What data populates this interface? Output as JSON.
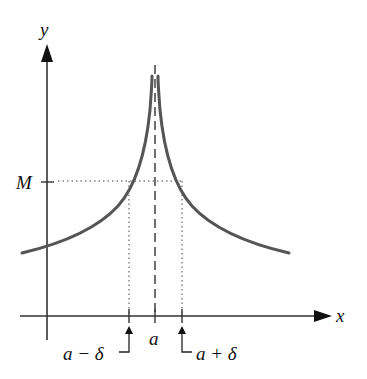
{
  "diagram": {
    "axes": {
      "x_label": "x",
      "y_label": "y"
    },
    "labels": {
      "M": "M",
      "a": "a",
      "a_minus_delta": "a − δ",
      "a_plus_delta": "a + δ"
    },
    "colors": {
      "curve": "#555555",
      "axis": "#333333",
      "guides": "#444444"
    }
  }
}
